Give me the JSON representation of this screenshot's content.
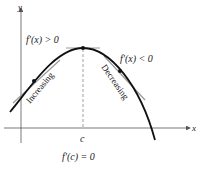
{
  "diagram": {
    "axes": {
      "x_label": "x",
      "y_label": "y"
    },
    "labels": {
      "left_derivative": "f′(x) > 0",
      "right_derivative": "f′(x) < 0",
      "increasing": "Increasing",
      "decreasing": "Decreasing",
      "critical_point": "c",
      "critical_condition": "f′(c) = 0"
    },
    "colors": {
      "curve": "#111111",
      "tangent": "#9a9a9a",
      "axis": "#555555"
    }
  }
}
